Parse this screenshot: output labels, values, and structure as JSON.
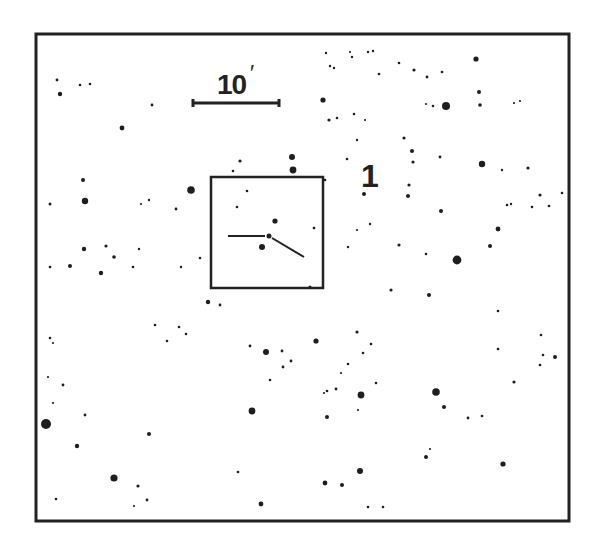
{
  "chart": {
    "scale_bar": {
      "label": "10",
      "unit_symbol": "′",
      "x1": 193,
      "x2": 279,
      "y": 103
    },
    "field_label": "1",
    "frame": {
      "x": 36,
      "y": 34,
      "w": 533,
      "h": 487,
      "stroke": "#222222"
    },
    "inset_box": {
      "x": 211,
      "y": 177,
      "w": 112,
      "h": 111
    },
    "marker": {
      "center": [
        269,
        236
      ],
      "left_tick": [
        [
          228,
          236
        ],
        [
          265,
          236
        ]
      ],
      "right_tick": [
        [
          272,
          238
        ],
        [
          304,
          257
        ]
      ]
    },
    "star_color": "#1e1e1e",
    "stars": [
      [
        57,
        80,
        1.4
      ],
      [
        60,
        94,
        2.2
      ],
      [
        80,
        85,
        1.3
      ],
      [
        90,
        84,
        1.3
      ],
      [
        152,
        105,
        1.4
      ],
      [
        122,
        128,
        2.4
      ],
      [
        83,
        180,
        2.0
      ],
      [
        85,
        201,
        3.2
      ],
      [
        50,
        204,
        1.5
      ],
      [
        141,
        204,
        1.1
      ],
      [
        149,
        200,
        1.2
      ],
      [
        176,
        209,
        1.4
      ],
      [
        191,
        190,
        3.8
      ],
      [
        84,
        249,
        2.2
      ],
      [
        106,
        246,
        1.6
      ],
      [
        114,
        257,
        1.8
      ],
      [
        139,
        249,
        1.2
      ],
      [
        70,
        266,
        2.0
      ],
      [
        101,
        273,
        2.2
      ],
      [
        50,
        267,
        1.3
      ],
      [
        133,
        267,
        1.3
      ],
      [
        181,
        267,
        1.2
      ],
      [
        200,
        258,
        1.3
      ],
      [
        240,
        161,
        1.6
      ],
      [
        233,
        171,
        1.3
      ],
      [
        292,
        157,
        3.0
      ],
      [
        293,
        170,
        3.4
      ],
      [
        247,
        191,
        1.3
      ],
      [
        237,
        207,
        1.3
      ],
      [
        275,
        221,
        2.6
      ],
      [
        262,
        247,
        3.0
      ],
      [
        314,
        228,
        1.3
      ],
      [
        208,
        302,
        2.2
      ],
      [
        220,
        305,
        1.4
      ],
      [
        179,
        327,
        1.3
      ],
      [
        155,
        325,
        1.3
      ],
      [
        186,
        334,
        1.3
      ],
      [
        167,
        341,
        1.3
      ],
      [
        50,
        338,
        1.3
      ],
      [
        53,
        343,
        1.1
      ],
      [
        48,
        377,
        1.1
      ],
      [
        63,
        385,
        1.4
      ],
      [
        53,
        403,
        1.1
      ],
      [
        85,
        415,
        1.4
      ],
      [
        46,
        424,
        5.0
      ],
      [
        77,
        446,
        2.2
      ],
      [
        149,
        434,
        2.0
      ],
      [
        114,
        478,
        3.6
      ],
      [
        138,
        486,
        1.6
      ],
      [
        147,
        500,
        1.4
      ],
      [
        134,
        506,
        1.1
      ],
      [
        56,
        499,
        1.3
      ],
      [
        250,
        346,
        1.4
      ],
      [
        266,
        352,
        3.0
      ],
      [
        282,
        351,
        1.4
      ],
      [
        291,
        361,
        1.4
      ],
      [
        283,
        367,
        1.4
      ],
      [
        270,
        380,
        1.3
      ],
      [
        252,
        411,
        3.4
      ],
      [
        238,
        472,
        1.3
      ],
      [
        261,
        504,
        2.4
      ],
      [
        330,
        66,
        1.2
      ],
      [
        326,
        53,
        1.2
      ],
      [
        334,
        68,
        1.2
      ],
      [
        350,
        52,
        1.1
      ],
      [
        368,
        52,
        1.2
      ],
      [
        373,
        51,
        1.2
      ],
      [
        323,
        100,
        2.6
      ],
      [
        329,
        120,
        1.6
      ],
      [
        337,
        118,
        1.3
      ],
      [
        352,
        57,
        1.2
      ],
      [
        379,
        74,
        1.3
      ],
      [
        399,
        63,
        1.3
      ],
      [
        414,
        70,
        1.6
      ],
      [
        427,
        77,
        1.4
      ],
      [
        442,
        72,
        1.3
      ],
      [
        476,
        59,
        2.6
      ],
      [
        479,
        92,
        2.0
      ],
      [
        480,
        105,
        1.8
      ],
      [
        426,
        104,
        1.1
      ],
      [
        433,
        106,
        1.3
      ],
      [
        446,
        106,
        4.0
      ],
      [
        514,
        103,
        1.1
      ],
      [
        520,
        101,
        1.1
      ],
      [
        354,
        114,
        1.3
      ],
      [
        365,
        120,
        1.1
      ],
      [
        357,
        140,
        1.2
      ],
      [
        404,
        138,
        1.6
      ],
      [
        412,
        151,
        2.0
      ],
      [
        413,
        162,
        1.6
      ],
      [
        440,
        157,
        1.4
      ],
      [
        482,
        164,
        3.2
      ],
      [
        502,
        170,
        1.2
      ],
      [
        528,
        168,
        1.6
      ],
      [
        347,
        159,
        1.3
      ],
      [
        325,
        180,
        1.3
      ],
      [
        364,
        194,
        2.0
      ],
      [
        408,
        196,
        2.0
      ],
      [
        441,
        211,
        2.0
      ],
      [
        507,
        205,
        1.3
      ],
      [
        511,
        204,
        1.2
      ],
      [
        532,
        207,
        1.3
      ],
      [
        549,
        206,
        1.3
      ],
      [
        540,
        195,
        1.6
      ],
      [
        562,
        193,
        1.3
      ],
      [
        498,
        229,
        2.4
      ],
      [
        490,
        246,
        2.0
      ],
      [
        457,
        260,
        4.4
      ],
      [
        409,
        185,
        1.6
      ],
      [
        370,
        224,
        1.2
      ],
      [
        357,
        230,
        1.1
      ],
      [
        314,
        228,
        1.2
      ],
      [
        399,
        245,
        1.6
      ],
      [
        348,
        247,
        1.2
      ],
      [
        429,
        295,
        2.0
      ],
      [
        391,
        290,
        1.6
      ],
      [
        426,
        254,
        1.3
      ],
      [
        327,
        417,
        2.0
      ],
      [
        310,
        287,
        1.6
      ],
      [
        316,
        341,
        2.6
      ],
      [
        357,
        332,
        1.6
      ],
      [
        371,
        344,
        1.3
      ],
      [
        363,
        353,
        1.3
      ],
      [
        348,
        364,
        1.3
      ],
      [
        341,
        373,
        1.1
      ],
      [
        336,
        389,
        1.4
      ],
      [
        361,
        395,
        3.4
      ],
      [
        327,
        391,
        1.3
      ],
      [
        324,
        393,
        1.1
      ],
      [
        376,
        383,
        1.3
      ],
      [
        436,
        392,
        3.8
      ],
      [
        444,
        407,
        2.0
      ],
      [
        468,
        418,
        1.4
      ],
      [
        482,
        416,
        1.3
      ],
      [
        498,
        311,
        1.3
      ],
      [
        498,
        349,
        1.3
      ],
      [
        514,
        382,
        1.6
      ],
      [
        541,
        335,
        1.3
      ],
      [
        543,
        355,
        1.3
      ],
      [
        555,
        357,
        2.0
      ],
      [
        540,
        365,
        1.3
      ],
      [
        430,
        449,
        1.1
      ],
      [
        426,
        457,
        2.0
      ],
      [
        503,
        464,
        2.6
      ],
      [
        360,
        471,
        3.0
      ],
      [
        325,
        483,
        2.4
      ],
      [
        342,
        485,
        2.0
      ],
      [
        368,
        507,
        1.3
      ],
      [
        383,
        507,
        1.3
      ],
      [
        358,
        410,
        1.1
      ]
    ]
  }
}
